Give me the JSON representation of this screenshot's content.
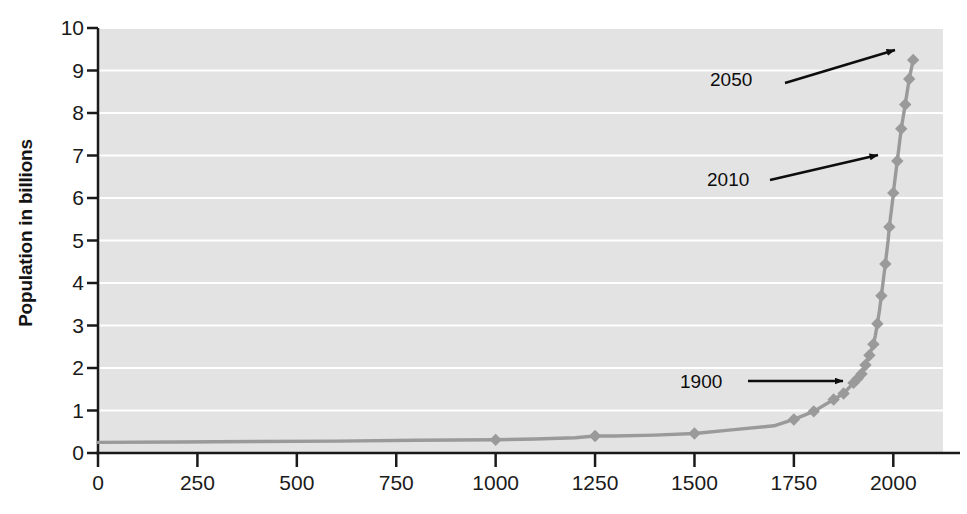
{
  "chart_data": {
    "type": "line",
    "title": "",
    "subtitle": "",
    "xlabel": "",
    "ylabel": "Population in billions",
    "xlim": [
      0,
      2125
    ],
    "ylim": [
      0,
      10
    ],
    "grid": "horizontal",
    "legend": "none",
    "marker": "diamond",
    "series_color": "#9a9a9a",
    "plot_background": "#e3e3e3",
    "gridline_color": "#ffffff",
    "x_ticks": [
      0,
      250,
      500,
      750,
      1000,
      1250,
      1500,
      1750,
      2000
    ],
    "x_tick_labels": [
      "0",
      "250",
      "500",
      "750",
      "1000",
      "1250",
      "1500",
      "1750",
      "2000"
    ],
    "y_ticks": [
      0,
      1,
      2,
      3,
      4,
      5,
      6,
      7,
      8,
      9,
      10
    ],
    "y_tick_labels": [
      "0",
      "1",
      "2",
      "3",
      "4",
      "5",
      "6",
      "7",
      "8",
      "9",
      "10"
    ],
    "series": [
      {
        "name": "World population",
        "x": [
          0,
          200,
          400,
          600,
          800,
          1000,
          1100,
          1200,
          1250,
          1300,
          1400,
          1500,
          1600,
          1700,
          1750,
          1800,
          1850,
          1875,
          1900,
          1910,
          1920,
          1927,
          1930,
          1940,
          1950,
          1955,
          1960,
          1965,
          1970,
          1974,
          1980,
          1987,
          1990,
          1999,
          2000,
          2010,
          2020,
          2030,
          2040,
          2050
        ],
        "y": [
          0.25,
          0.26,
          0.27,
          0.28,
          0.3,
          0.31,
          0.33,
          0.36,
          0.4,
          0.4,
          0.42,
          0.46,
          0.55,
          0.64,
          0.79,
          0.98,
          1.26,
          1.4,
          1.65,
          1.75,
          1.86,
          2.0,
          2.07,
          2.3,
          2.56,
          2.77,
          3.04,
          3.34,
          3.7,
          4.0,
          4.45,
          5.0,
          5.32,
          6.0,
          6.12,
          6.87,
          7.63,
          8.2,
          8.8,
          9.25
        ],
        "markers_x": [
          1000,
          1250,
          1500,
          1750,
          1800,
          1850,
          1875,
          1900,
          1910,
          1920,
          1930,
          1940,
          1950,
          1960,
          1970,
          1980,
          1990,
          2000,
          2010,
          2020,
          2030,
          2040,
          2050
        ],
        "markers_y": [
          0.31,
          0.4,
          0.46,
          0.79,
          0.98,
          1.26,
          1.4,
          1.65,
          1.75,
          1.86,
          2.07,
          2.3,
          2.56,
          3.04,
          3.7,
          4.45,
          5.32,
          6.12,
          6.87,
          7.63,
          8.2,
          8.8,
          9.25
        ]
      }
    ],
    "annotations": [
      {
        "text": "2050",
        "x": 2050,
        "y": 9.25,
        "label_px": {
          "x": 710,
          "y": 70
        },
        "arrow_from_px": {
          "x": 785,
          "y": 83
        },
        "arrow_to_px": {
          "x": 895,
          "y": 50
        }
      },
      {
        "text": "2010",
        "x": 2010,
        "y": 6.87,
        "label_px": {
          "x": 707,
          "y": 170
        },
        "arrow_from_px": {
          "x": 770,
          "y": 180
        },
        "arrow_to_px": {
          "x": 878,
          "y": 155
        }
      },
      {
        "text": "1900",
        "x": 1900,
        "y": 1.65,
        "label_px": {
          "x": 680,
          "y": 372
        },
        "arrow_from_px": {
          "x": 748,
          "y": 381
        },
        "arrow_to_px": {
          "x": 843,
          "y": 381
        }
      }
    ]
  }
}
